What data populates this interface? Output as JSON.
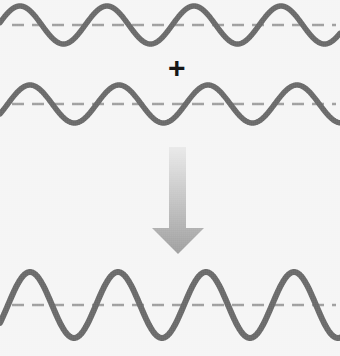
{
  "figure": {
    "background_color": "#f4f4f4",
    "width": 340,
    "height": 356,
    "operator_symbol": "+",
    "operator_color": "#161616",
    "wave_color": "#4b4b4b",
    "axis_color": "#8d8d8d",
    "arrow_color_top": "#e2e2e2",
    "arrow_color_bottom": "#8f8f8f"
  },
  "waves": [
    {
      "name": "wave-one",
      "label": "Wave 1",
      "midline_y": 25,
      "amplitude": 19,
      "wavelength": 87,
      "phase_crest_x": 20,
      "x_start": 0,
      "x_end": 340,
      "stroke_width": 5.5,
      "color": "#4b4b4b",
      "axis_y": 25,
      "axis_color": "#8d8d8d",
      "axis_dash": "12 8",
      "axis_width": 2.4,
      "axis_x_start": 12,
      "axis_x_end": 336
    },
    {
      "name": "wave-two",
      "label": "Wave 2",
      "midline_y": 104,
      "amplitude": 19,
      "wavelength": 89,
      "phase_crest_x": 30,
      "x_start": 0,
      "x_end": 340,
      "stroke_width": 5.5,
      "color": "#4b4b4b",
      "axis_y": 104,
      "axis_color": "#8d8d8d",
      "axis_dash": "12 8",
      "axis_width": 2.4,
      "axis_x_start": 12,
      "axis_x_end": 336
    },
    {
      "name": "wave-sum",
      "label": "Resultant wave",
      "midline_y": 305,
      "amplitude": 33,
      "wavelength": 88,
      "phase_crest_x": 30,
      "x_start": 0,
      "x_end": 340,
      "stroke_width": 6,
      "color": "#4b4b4b",
      "axis_y": 305,
      "axis_color": "#8d8d8d",
      "axis_dash": "12 8",
      "axis_width": 2.4,
      "axis_x_start": 12,
      "axis_x_end": 336
    }
  ],
  "operator": {
    "symbol": "+",
    "x": 168,
    "y": 53,
    "size": 30
  },
  "arrow": {
    "name": "down-arrow",
    "shaft_x": 169,
    "shaft_width": 17,
    "shaft_top_y": 147,
    "shaft_bottom_y": 228,
    "head_left_x": 152,
    "head_right_x": 204,
    "head_top_y": 228,
    "tip_x": 178,
    "tip_y": 254,
    "gradient_start": "#e6e6e6",
    "gradient_end": "#8c8c8c"
  },
  "chart_data": {
    "type": "line",
    "xlabel": "",
    "ylabel": "",
    "series": [
      {
        "name": "Wave 1",
        "amplitude": 19,
        "wavelength": 87,
        "phase_crest_x": 20,
        "midline_y": 25
      },
      {
        "name": "Wave 2",
        "amplitude": 19,
        "wavelength": 89,
        "phase_crest_x": 30,
        "midline_y": 104
      },
      {
        "name": "Resultant wave",
        "amplitude": 33,
        "wavelength": 88,
        "phase_crest_x": 30,
        "midline_y": 305
      }
    ],
    "annotations": [
      "+",
      "down-arrow"
    ],
    "grid": false,
    "legend": "none"
  }
}
